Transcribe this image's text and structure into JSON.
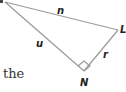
{
  "diagram": {
    "type": "right-triangle",
    "vertices": [
      {
        "label": "",
        "x": 5,
        "y": 2
      },
      {
        "label": "L",
        "x": 118,
        "y": 30
      },
      {
        "label": "N",
        "x": 84,
        "y": 71
      }
    ],
    "sides": [
      {
        "label": "n",
        "from": "top-left",
        "to": "L"
      },
      {
        "label": "u",
        "from": "top-left",
        "to": "N"
      },
      {
        "label": "r",
        "from": "L",
        "to": "N"
      }
    ],
    "right_angle_at": "N",
    "line_color": "#999999"
  },
  "labels": {
    "vertex_L": "L",
    "vertex_N": "N",
    "side_n": "n",
    "side_u": "u",
    "side_r": "r"
  },
  "caption_fragment": "the"
}
